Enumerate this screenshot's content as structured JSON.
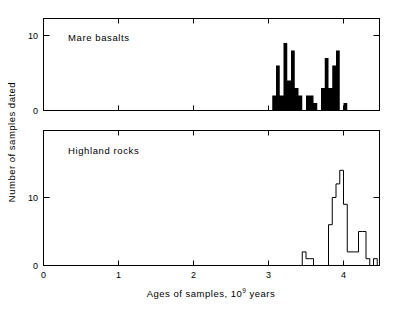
{
  "figure": {
    "xlabel_part1": "Ages of samples, 10",
    "xlabel_exp": "9",
    "xlabel_part2": "years",
    "ylabel": "Number of samples dated",
    "xticks": [
      "0",
      "1",
      "2",
      "3",
      "4"
    ],
    "panel_top_yticks": [
      "0",
      "10"
    ],
    "panel_bottom_yticks": [
      "0",
      "10"
    ],
    "panel_top_title": "Mare basalts",
    "panel_bottom_title": "Highland rocks",
    "ink_color": "#000000",
    "background_color": "#ffffff"
  },
  "chart_data": [
    {
      "type": "bar",
      "title": "Mare basalts",
      "subtitle": "",
      "xlabel": "Ages of samples, 10^9 years",
      "ylabel": "Number of samples dated",
      "xlim": [
        0,
        4.48
      ],
      "ylim": [
        0,
        12
      ],
      "xticks": [
        0,
        1,
        2,
        3,
        4
      ],
      "yticks": [
        0,
        10
      ],
      "grid": false,
      "legend": "none",
      "style": "filled-black",
      "bin_width": 0.05,
      "bin_left_edges": [
        3.05,
        3.1,
        3.15,
        3.2,
        3.25,
        3.3,
        3.35,
        3.4,
        3.45,
        3.5,
        3.55,
        3.6,
        3.65,
        3.7,
        3.75,
        3.8,
        3.85,
        3.9,
        3.95,
        4.0,
        4.05
      ],
      "values": [
        2,
        6,
        2,
        9,
        4,
        8,
        3,
        2,
        0,
        2,
        2,
        1,
        0,
        3,
        7,
        3,
        6,
        8,
        0,
        1,
        0
      ]
    },
    {
      "type": "bar",
      "title": "Highland rocks",
      "subtitle": "",
      "xlabel": "Ages of samples, 10^9 years",
      "ylabel": "Number of samples dated",
      "xlim": [
        0,
        4.48
      ],
      "ylim": [
        0,
        17
      ],
      "xticks": [
        0,
        1,
        2,
        3,
        4
      ],
      "yticks": [
        0,
        10
      ],
      "grid": false,
      "legend": "none",
      "style": "outline",
      "bin_width": 0.05,
      "bin_left_edges": [
        3.45,
        3.5,
        3.55,
        3.6,
        3.65,
        3.7,
        3.75,
        3.8,
        3.85,
        3.9,
        3.95,
        4.0,
        4.05,
        4.1,
        4.15,
        4.2,
        4.25,
        4.3,
        4.35,
        4.4
      ],
      "values": [
        2,
        1,
        1,
        0,
        0,
        0,
        0,
        6,
        10,
        12,
        14,
        9,
        2,
        2,
        2,
        5,
        5,
        1,
        0,
        1
      ]
    }
  ]
}
